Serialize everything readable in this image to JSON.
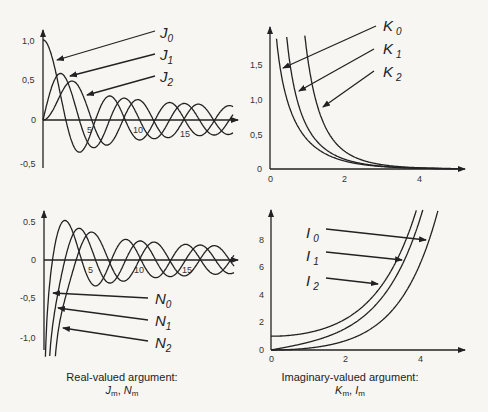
{
  "chart_data": [
    {
      "id": "J",
      "type": "line",
      "title": "",
      "xlabel": "",
      "ylabel": "",
      "x_ticks": [
        "5",
        "10",
        "15"
      ],
      "y_ticks": [
        "1,0",
        "0,5",
        "0",
        "-0,5"
      ],
      "xlim": [
        0,
        20
      ],
      "ylim": [
        -0.5,
        1.0
      ],
      "series": [
        {
          "name": "J0",
          "label": "J",
          "sub": "0",
          "function": "BesselJ order 0"
        },
        {
          "name": "J1",
          "label": "J",
          "sub": "1",
          "function": "BesselJ order 1"
        },
        {
          "name": "J2",
          "label": "J",
          "sub": "2",
          "function": "BesselJ order 2"
        }
      ],
      "samples": {
        "x": [
          0,
          1,
          2,
          3,
          5,
          10,
          15
        ],
        "J0": [
          1.0,
          0.77,
          0.22,
          -0.26,
          -0.18,
          -0.25,
          -0.01
        ],
        "J1": [
          0.0,
          0.44,
          0.58,
          0.34,
          -0.33,
          0.04,
          0.21
        ],
        "J2": [
          0.0,
          0.11,
          0.35,
          0.49,
          0.05,
          0.25,
          0.04
        ]
      }
    },
    {
      "id": "K",
      "type": "line",
      "title": "",
      "x_ticks": [
        "0",
        "2",
        "4"
      ],
      "y_ticks": [
        "1,5",
        "1,0",
        "0,5",
        "0"
      ],
      "xlim": [
        0,
        5.3
      ],
      "ylim": [
        0,
        1.95
      ],
      "series": [
        {
          "name": "K0",
          "label": "K",
          "sub": "0",
          "function": "BesselK order 0"
        },
        {
          "name": "K1",
          "label": "K",
          "sub": "1",
          "function": "BesselK order 1"
        },
        {
          "name": "K2",
          "label": "K",
          "sub": "2",
          "function": "BesselK order 2"
        }
      ],
      "samples": {
        "x": [
          0.5,
          1,
          2,
          3,
          4
        ],
        "K0": [
          0.92,
          0.42,
          0.11,
          0.035,
          0.011
        ],
        "K1": [
          1.66,
          0.6,
          0.14,
          0.04,
          0.012
        ],
        "K2": [
          7.55,
          1.62,
          0.25,
          0.06,
          0.017
        ]
      }
    },
    {
      "id": "N",
      "type": "line",
      "x_ticks": [
        "5",
        "10",
        "15"
      ],
      "y_ticks": [
        "0.5",
        "0",
        "-0,5",
        "-1,0"
      ],
      "xlim": [
        0,
        20
      ],
      "ylim": [
        -1.2,
        0.5
      ],
      "series": [
        {
          "name": "N0",
          "label": "N",
          "sub": "0",
          "function": "BesselY order 0"
        },
        {
          "name": "N1",
          "label": "N",
          "sub": "1",
          "function": "BesselY order 1"
        },
        {
          "name": "N2",
          "label": "N",
          "sub": "2",
          "function": "BesselY order 2"
        }
      ],
      "samples": {
        "x": [
          1,
          2,
          3,
          5,
          10,
          15
        ],
        "N0": [
          0.09,
          0.51,
          0.38,
          -0.31,
          0.06,
          0.21
        ],
        "N1": [
          -0.78,
          -0.11,
          0.32,
          0.15,
          0.25,
          0.02
        ],
        "N2": [
          -1.65,
          -0.62,
          -0.16,
          0.37,
          -0.01,
          -0.18
        ]
      }
    },
    {
      "id": "I",
      "type": "line",
      "x_ticks": [
        "0",
        "2",
        "4"
      ],
      "y_ticks": [
        "8",
        "6",
        "4",
        "2",
        "0"
      ],
      "xlim": [
        0,
        5.3
      ],
      "ylim": [
        0,
        9.5
      ],
      "series": [
        {
          "name": "I0",
          "label": "I",
          "sub": "0",
          "function": "BesselI order 0"
        },
        {
          "name": "I1",
          "label": "I",
          "sub": "1",
          "function": "BesselI order 1"
        },
        {
          "name": "I2",
          "label": "I",
          "sub": "2",
          "function": "BesselI order 2"
        }
      ],
      "samples": {
        "x": [
          0,
          1,
          2,
          3,
          4
        ],
        "I0": [
          1.0,
          1.27,
          2.28,
          4.88,
          11.3
        ],
        "I1": [
          0.0,
          0.57,
          1.59,
          3.95,
          9.76
        ],
        "I2": [
          0.0,
          0.14,
          0.69,
          2.25,
          6.42
        ]
      }
    }
  ],
  "captions": {
    "left": {
      "line1": "Real-valued argument:",
      "line2_a": "J",
      "line2_a_sub": "m",
      "line2_sep": ", ",
      "line2_b": "N",
      "line2_b_sub": "m"
    },
    "right": {
      "line1": "Imaginary-valued argument:",
      "line2_a": "K",
      "line2_a_sub": "m",
      "line2_sep": ", ",
      "line2_b": "I",
      "line2_b_sub": "m"
    }
  }
}
